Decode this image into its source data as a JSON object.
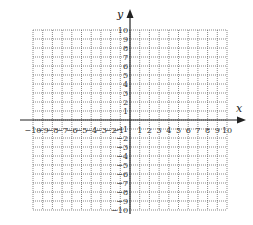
{
  "chart_data": {
    "type": "coordinate-grid",
    "title": "",
    "xlabel": "x",
    "ylabel": "y",
    "xlim": [
      -10,
      10
    ],
    "ylim": [
      -10,
      10
    ],
    "grid": true,
    "grid_style": "dotted",
    "x_ticks": [
      -10,
      -9,
      -8,
      -7,
      -6,
      -5,
      -4,
      -3,
      -2,
      -1,
      1,
      2,
      3,
      4,
      5,
      6,
      7,
      8,
      9,
      10
    ],
    "y_ticks": [
      10,
      9,
      8,
      7,
      6,
      5,
      4,
      3,
      2,
      1,
      -1,
      -2,
      -3,
      -4,
      -5,
      -6,
      -7,
      -8,
      -9,
      -10
    ],
    "series": []
  },
  "colors": {
    "grid": "#555555",
    "axis": "#222222",
    "text": "#333333",
    "background": "#ffffff"
  }
}
